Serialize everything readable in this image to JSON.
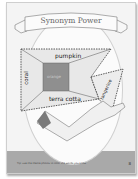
{
  "worksheet": {
    "title": "Synonym Power",
    "center_word": "orange",
    "synonyms": {
      "top": "pumpkin",
      "left": "coral",
      "bottom": "terra cotta",
      "right": "tangerine"
    },
    "footer_text": "Tip: use the theme photos to color the words you know",
    "page_number": "8"
  },
  "colors": {
    "page": "#f4f4f4",
    "footer_band": "#a9a9a9",
    "center_box": "#8f8f8f",
    "frame_fill": "#e8e8e8"
  }
}
